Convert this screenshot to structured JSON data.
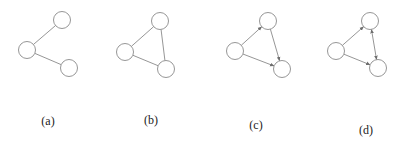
{
  "figure": {
    "panels": [
      {
        "label": "(a)",
        "directed": false,
        "label_pos": [
          48,
          114
        ],
        "nodes": [
          {
            "id": "left",
            "x": 27,
            "y": 50
          },
          {
            "id": "top",
            "x": 62,
            "y": 20
          },
          {
            "id": "bottom",
            "x": 69,
            "y": 68
          }
        ],
        "edges": [
          {
            "from": "left",
            "to": "top",
            "arrow": "none"
          },
          {
            "from": "left",
            "to": "bottom",
            "arrow": "none"
          }
        ]
      },
      {
        "label": "(b)",
        "directed": false,
        "label_pos": [
          151,
          113
        ],
        "nodes": [
          {
            "id": "left",
            "x": 125,
            "y": 52
          },
          {
            "id": "top",
            "x": 160,
            "y": 21
          },
          {
            "id": "bottom",
            "x": 166,
            "y": 69
          }
        ],
        "edges": [
          {
            "from": "left",
            "to": "top",
            "arrow": "none"
          },
          {
            "from": "left",
            "to": "bottom",
            "arrow": "none"
          },
          {
            "from": "top",
            "to": "bottom",
            "arrow": "none"
          }
        ]
      },
      {
        "label": "(c)",
        "directed": true,
        "label_pos": [
          256,
          118
        ],
        "nodes": [
          {
            "id": "left",
            "x": 235,
            "y": 51
          },
          {
            "id": "top",
            "x": 268,
            "y": 21
          },
          {
            "id": "bottom",
            "x": 282,
            "y": 69
          }
        ],
        "edges": [
          {
            "from": "left",
            "to": "top",
            "arrow": "end"
          },
          {
            "from": "left",
            "to": "bottom",
            "arrow": "end"
          },
          {
            "from": "top",
            "to": "bottom",
            "arrow": "end"
          }
        ]
      },
      {
        "label": "(d)",
        "directed": true,
        "label_pos": [
          366,
          123
        ],
        "nodes": [
          {
            "id": "left",
            "x": 336,
            "y": 51
          },
          {
            "id": "top",
            "x": 370,
            "y": 21
          },
          {
            "id": "bottom",
            "x": 378,
            "y": 68
          }
        ],
        "edges": [
          {
            "from": "left",
            "to": "top",
            "arrow": "end"
          },
          {
            "from": "left",
            "to": "bottom",
            "arrow": "end"
          },
          {
            "from": "top",
            "to": "bottom",
            "arrow": "both"
          }
        ]
      }
    ],
    "node_radius": 8.5,
    "stroke_color": "#8a8a8a"
  }
}
